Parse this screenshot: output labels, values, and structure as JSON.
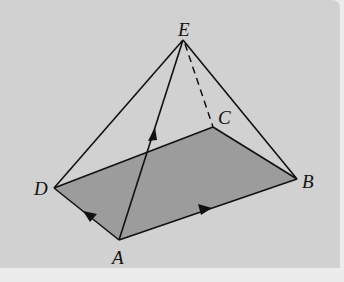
{
  "diagram": {
    "type": "pyramid",
    "vertices": {
      "A": {
        "label": "A",
        "x": 119,
        "y": 240
      },
      "B": {
        "label": "B",
        "x": 297,
        "y": 179
      },
      "C": {
        "label": "C",
        "x": 213,
        "y": 127
      },
      "D": {
        "label": "D",
        "x": 54,
        "y": 188
      },
      "E": {
        "label": "E",
        "x": 183,
        "y": 40
      }
    },
    "base": [
      "A",
      "B",
      "C",
      "D"
    ],
    "edges_solid": [
      [
        "A",
        "B"
      ],
      [
        "B",
        "C"
      ],
      [
        "C",
        "D"
      ],
      [
        "D",
        "A"
      ],
      [
        "E",
        "D"
      ],
      [
        "E",
        "B"
      ],
      [
        "E",
        "A"
      ]
    ],
    "edges_hidden": [
      [
        "E",
        "C"
      ]
    ],
    "vectors": [
      {
        "from": "A",
        "to": "B",
        "label": "AB"
      },
      {
        "from": "A",
        "to": "D",
        "label": "AD"
      },
      {
        "from": "A",
        "to": "E",
        "label": "AE"
      }
    ],
    "colors": {
      "background": "#d1d1d1",
      "base_fill": "#9c9c9c",
      "line": "#111111",
      "outer": "#ececec"
    }
  }
}
